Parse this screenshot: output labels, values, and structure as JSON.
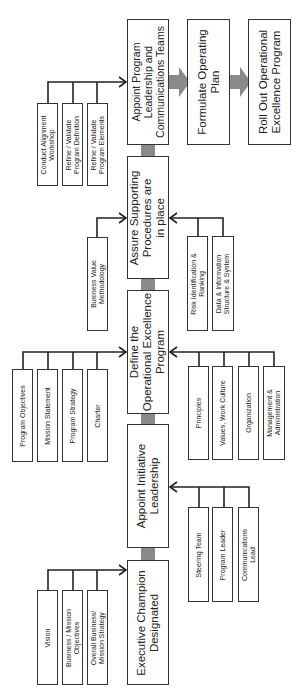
{
  "main_steps": [
    {
      "id": "executive",
      "label": "Executive Champion Designated"
    },
    {
      "id": "appoint_initiative",
      "label": "Appoint Initiative Leadership"
    },
    {
      "id": "define",
      "label": "Define the Operational Excellence Program"
    },
    {
      "id": "assure",
      "label": "Assure Supporting Procedures are in place"
    },
    {
      "id": "appoint_program",
      "label": "Appoint Program Leadership and Communications Teams"
    },
    {
      "id": "formulate",
      "label": "Formulate Operating Plan"
    },
    {
      "id": "rollout",
      "label": "Roll Out Operational Excellence Program"
    }
  ],
  "main_lines": {
    "executive": [
      "Executive Champion",
      "Designated"
    ],
    "appoint_initiative": [
      "Appoint Initiative",
      "Leadership"
    ],
    "define": [
      "Define the",
      "Operational Excellence",
      "Program"
    ],
    "assure": [
      "Assure Supporting",
      "Procedures are",
      "in place"
    ],
    "appoint_program": [
      "Appoint Program",
      "Leadership and",
      "Communications Teams"
    ],
    "formulate": [
      "Formulate Operating",
      "Plan"
    ],
    "rollout": [
      "Roll Out Operational",
      "Excellence Program"
    ]
  },
  "inputs": {
    "executive_left": [
      [
        "Vision"
      ],
      [
        "Business / Mission",
        "Objectives"
      ],
      [
        "Overall Business/",
        "Mission Strategy"
      ]
    ],
    "appoint_initiative_right": [
      [
        "Steering Team"
      ],
      [
        "Program Leader"
      ],
      [
        "Communications",
        "Lead"
      ]
    ],
    "define_left": [
      [
        "Program Objectives"
      ],
      [
        "Mission Statement"
      ],
      [
        "Program Strategy"
      ],
      [
        "Charter"
      ]
    ],
    "define_right": [
      [
        "Principles"
      ],
      [
        "Values, Work Culture"
      ],
      [
        "Organization"
      ],
      [
        "Management &",
        "Administration"
      ]
    ],
    "assure_left": [
      [
        "Business Value",
        "Methodology"
      ]
    ],
    "assure_right": [
      [
        "Risk Identification &",
        "Ranking"
      ],
      [
        "Data & Information",
        "Structure & System"
      ]
    ],
    "appoint_program_left": [
      [
        "Conduct Alignment",
        "Workshop"
      ],
      [
        "Refine / Validate",
        "Program Definition"
      ],
      [
        "Refine / Validate",
        "Program Elements"
      ]
    ]
  },
  "colors": {
    "flow_arrow": "#8a8a8a",
    "line": "#222222",
    "border": "#333333"
  }
}
